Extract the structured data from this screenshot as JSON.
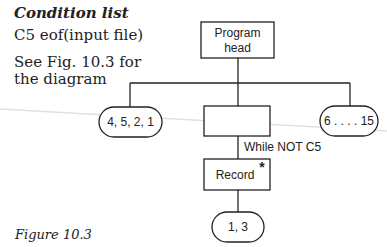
{
  "condition_list": {
    "title": "Condition list",
    "items": [
      "C5 eof(input file)"
    ],
    "note_line1": "See Fig. 10.3 for",
    "note_line2": "the diagram"
  },
  "diagram": {
    "root": {
      "label_line1": "Program",
      "label_line2": "head"
    },
    "left_leaf": {
      "label": "4, 5, 2, 1"
    },
    "middle_box": {
      "label": ""
    },
    "right_leaf": {
      "label": "6 . . . . 15"
    },
    "iteration_condition": "While NOT C5",
    "record_box": {
      "label": "Record",
      "marker": "*"
    },
    "bottom_leaf": {
      "label": "1, 3"
    },
    "colors": {
      "stroke": "#222222",
      "artifact_line": "#dddddd"
    }
  },
  "caption": "Figure 10.3"
}
